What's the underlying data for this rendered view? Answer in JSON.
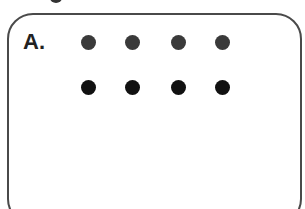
{
  "figure": {
    "panel_label": "A.",
    "grid": {
      "rows": 2,
      "cols": 4,
      "dots": [
        {
          "row": 0,
          "col": 0,
          "color": "#3a3a3a"
        },
        {
          "row": 0,
          "col": 1,
          "color": "#3a3a3a"
        },
        {
          "row": 0,
          "col": 2,
          "color": "#3a3a3a"
        },
        {
          "row": 0,
          "col": 3,
          "color": "#3a3a3a"
        },
        {
          "row": 1,
          "col": 0,
          "color": "#111111"
        },
        {
          "row": 1,
          "col": 1,
          "color": "#111111"
        },
        {
          "row": 1,
          "col": 2,
          "color": "#111111"
        },
        {
          "row": 1,
          "col": 3,
          "color": "#111111"
        }
      ]
    },
    "colors": {
      "border": "#4a4a4a",
      "background": "#ffffff"
    }
  }
}
